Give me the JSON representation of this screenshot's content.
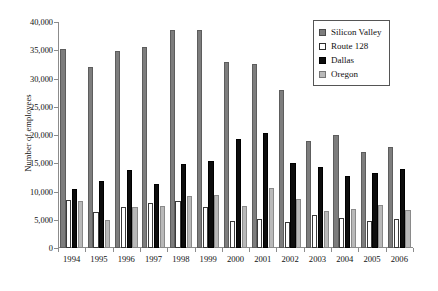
{
  "chart_data": {
    "type": "bar",
    "title": "",
    "xlabel": "",
    "ylabel": "Number of employees",
    "ylim": [
      0,
      40000
    ],
    "yticks": [
      0,
      5000,
      10000,
      15000,
      20000,
      25000,
      30000,
      35000,
      40000
    ],
    "ytick_labels": [
      "0",
      "5,000",
      "10,000",
      "15,000",
      "20,000",
      "25,000",
      "30,000",
      "35,000",
      "40,000"
    ],
    "grid": false,
    "legend_position": "top-right",
    "categories": [
      "1994",
      "1995",
      "1996",
      "1997",
      "1998",
      "1999",
      "2000",
      "2001",
      "2002",
      "2003",
      "2004",
      "2005",
      "2006"
    ],
    "series": [
      {
        "name": "Silicon Valley",
        "color": "#7d7d7d",
        "values": [
          35300,
          32100,
          34800,
          35600,
          38500,
          38500,
          33000,
          32600,
          28000,
          18900,
          20000,
          17000,
          17800
        ]
      },
      {
        "name": "Route 128",
        "color": "#ffffff",
        "values": [
          8500,
          6300,
          7300,
          7900,
          8400,
          7200,
          4800,
          5100,
          4600,
          5800,
          5400,
          4800,
          5200
        ]
      },
      {
        "name": "Dallas",
        "color": "#0d0d0d",
        "values": [
          10400,
          11800,
          13800,
          11400,
          14800,
          15400,
          19300,
          20300,
          15000,
          14400,
          12800,
          13200,
          13900
        ]
      },
      {
        "name": "Oregon",
        "color": "#b9b9b9",
        "values": [
          8400,
          4900,
          7300,
          7500,
          9200,
          9400,
          7500,
          10600,
          8600,
          6600,
          6900,
          7700,
          6800
        ]
      }
    ]
  },
  "legend": {
    "items": [
      {
        "label": "Silicon Valley",
        "swatch": "swatch-silicon-valley"
      },
      {
        "label": "Route 128",
        "swatch": "swatch-route-128"
      },
      {
        "label": "Dallas",
        "swatch": "swatch-dallas"
      },
      {
        "label": "Oregon",
        "swatch": "swatch-oregon"
      }
    ]
  }
}
